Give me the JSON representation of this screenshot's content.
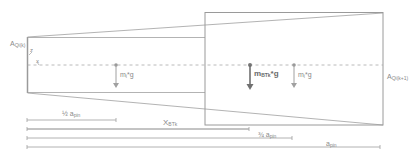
{
  "diagram": {
    "type": "beam-section-weights",
    "colors": {
      "line": "#9a9a9a",
      "dash": "#a8a8a8",
      "arrow_light": "#a0a0a0",
      "arrow_bold": "#707070"
    },
    "sections": {
      "left": {
        "label_main": "A",
        "label_sub": "Qi(k)"
      },
      "right": {
        "label_main": "A",
        "label_sub": "Qi(k+1)"
      }
    },
    "axes": {
      "z": "z",
      "x": "x"
    },
    "forces": [
      {
        "id": "left",
        "label_main": "m",
        "label_sub": "i",
        "label_suffix": "*g",
        "bold": false
      },
      {
        "id": "center",
        "label_main": "m",
        "label_sub": "BTk",
        "label_suffix": "*g",
        "bold": true
      },
      {
        "id": "right",
        "label_main": "m",
        "label_sub": "i",
        "label_suffix": "*g",
        "bold": false
      }
    ],
    "dimensions": [
      {
        "id": "half-a-pin",
        "label_main": "½ a",
        "label_sub": "pin"
      },
      {
        "id": "x-btk",
        "label_main": "X",
        "label_sub": "BTk"
      },
      {
        "id": "three-quarter-a-pin",
        "label_main": "¾ a",
        "label_sub": "pin"
      },
      {
        "id": "a-pin",
        "label_main": "a",
        "label_sub": "pin"
      }
    ]
  }
}
